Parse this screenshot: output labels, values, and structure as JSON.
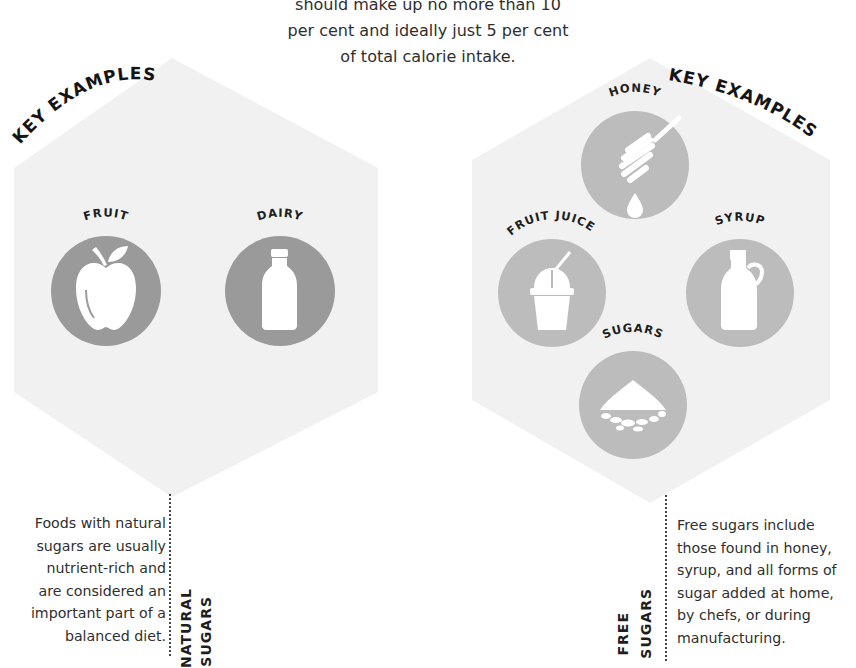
{
  "intro": {
    "lines": [
      "should make up no more than 10",
      "per cent and ideally just 5 per cent",
      "of total calorie intake."
    ]
  },
  "natural": {
    "key_label": "KEY EXAMPLES",
    "title_line1": "NATURAL",
    "title_line2": "SUGARS",
    "description_lines": [
      "Foods with natural",
      "sugars are usually",
      "nutrient-rich and",
      "are considered an",
      "important part of a",
      "balanced diet."
    ],
    "examples": [
      {
        "label": "FRUIT",
        "icon": "apple-icon"
      },
      {
        "label": "DAIRY",
        "icon": "milk-bottle-icon"
      }
    ]
  },
  "free": {
    "key_label": "KEY EXAMPLES",
    "title_line1": "FREE",
    "title_line2": "SUGARS",
    "description_lines": [
      "Free sugars include",
      "those found in honey,",
      "syrup, and all forms of",
      "sugar added at home,",
      "by chefs, or during",
      "manufacturing."
    ],
    "examples": [
      {
        "label": "HONEY",
        "icon": "honey-dipper-icon"
      },
      {
        "label": "FRUIT JUICE",
        "icon": "smoothie-cup-icon"
      },
      {
        "label": "SYRUP",
        "icon": "syrup-jug-icon"
      },
      {
        "label": "SUGARS",
        "icon": "sugar-pile-icon"
      }
    ]
  },
  "colors": {
    "hexagon_fill": "#f1f1f1",
    "natural_circle": "#9a9a9a",
    "free_circle": "#bcbcbc",
    "icon_fill": "#ffffff",
    "text": "#2f2f2f"
  }
}
